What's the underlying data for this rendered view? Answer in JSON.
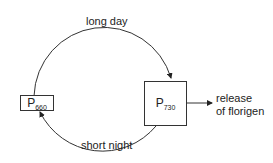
{
  "diagram": {
    "nodes": {
      "p660": {
        "main": "P",
        "sub": "660"
      },
      "p730": {
        "main": "P",
        "sub": "730"
      }
    },
    "edges": {
      "top": "long day",
      "bottom": "short night"
    },
    "output": {
      "line1": "release",
      "line2": "of florigen"
    }
  }
}
